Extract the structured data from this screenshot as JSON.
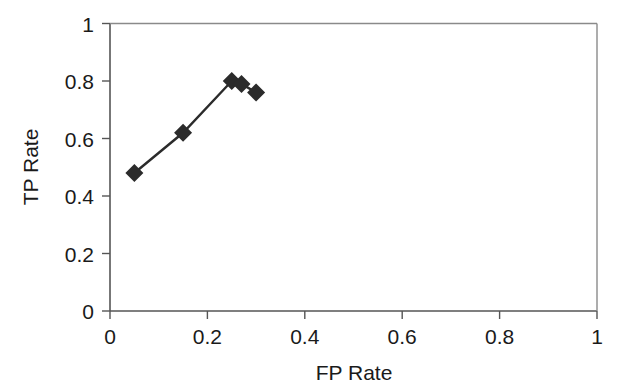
{
  "chart_data": {
    "type": "line",
    "title": "",
    "subtitle": "",
    "xlabel": "FP Rate",
    "ylabel": "TP Rate",
    "xlim": [
      0,
      1
    ],
    "ylim": [
      0,
      1
    ],
    "grid": false,
    "legend": null,
    "legend_position": "none",
    "marker": "diamond",
    "marker_color": "#2b2b2b",
    "line_color": "#2b2b2b",
    "axis_color": "#555555",
    "xticks": [
      0,
      0.2,
      0.4,
      0.6,
      0.8,
      1
    ],
    "xtick_labels": [
      "0",
      "0.2",
      "0.4",
      "0.6",
      "0.8",
      "1"
    ],
    "yticks": [
      0,
      0.2,
      0.4,
      0.6,
      0.8,
      1
    ],
    "ytick_labels": [
      "0",
      "0.2",
      "0.4",
      "0.6",
      "0.8",
      "1"
    ],
    "series": [
      {
        "name": "ROC curve",
        "x": [
          0.05,
          0.15,
          0.25,
          0.27,
          0.3
        ],
        "y": [
          0.48,
          0.62,
          0.8,
          0.79,
          0.76
        ]
      }
    ],
    "annotations": []
  }
}
